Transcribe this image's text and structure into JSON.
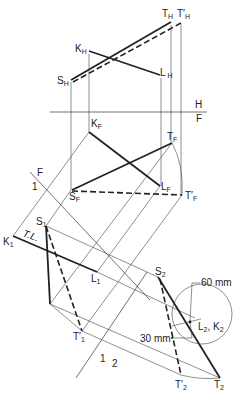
{
  "diagram": {
    "type": "descriptive-geometry auxiliary view construction",
    "fold_lines": [
      {
        "id": "HF",
        "top": "H",
        "bottom": "F"
      },
      {
        "id": "F1",
        "top": "F",
        "bottom": "1"
      },
      {
        "id": "12",
        "top": "1",
        "bottom": "2"
      }
    ],
    "labels": {
      "TH": "T",
      "TH_sub": "H",
      "TpH": "T′",
      "TpH_sub": "H",
      "KH": "K",
      "KH_sub": "H",
      "LH": "L",
      "LH_sub": "H",
      "SH": "S",
      "SH_sub": "H",
      "KF": "K",
      "KF_sub": "F",
      "TF": "T",
      "TF_sub": "F",
      "LF": "L",
      "LF_sub": "F",
      "SF": "S",
      "SF_sub": "F",
      "TpF": "T′",
      "TpF_sub": "F",
      "S1": "S",
      "S1_sub": "1",
      "K1": "K",
      "K1_sub": "1",
      "L1": "L",
      "L1_sub": "1",
      "Tp1": "T′",
      "Tp1_sub": "1",
      "S2": "S",
      "S2_sub": "2",
      "Tp2": "T′",
      "Tp2_sub": "2",
      "T2": "T",
      "T2_sub": "2",
      "L2K2": "L",
      "L2K2_sub1": "2",
      "L2K2_mid": ", K",
      "L2K2_sub2": "2",
      "TL": "T.L.",
      "H": "H",
      "F": "F",
      "F_aux": "F",
      "one": "1",
      "one_b": "1",
      "two": "2"
    },
    "dimensions": {
      "radius": "60 mm",
      "offset": "30 mm"
    }
  }
}
